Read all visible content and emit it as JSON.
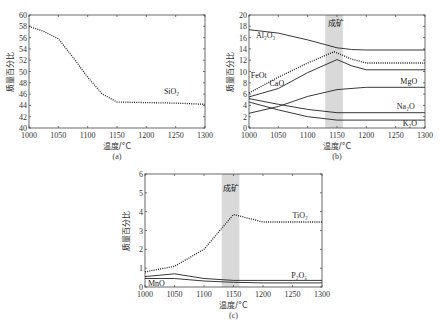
{
  "chart_data": [
    {
      "id": "a",
      "type": "line",
      "caption": "(a)",
      "xlabel": "温度/°C",
      "ylabel": "质量百分比",
      "xlim": [
        1000,
        1300
      ],
      "ylim": [
        40,
        60
      ],
      "xticks": [
        1000,
        1050,
        1100,
        1150,
        1200,
        1250,
        1300
      ],
      "yticks": [
        40,
        42,
        44,
        46,
        48,
        50,
        52,
        54,
        56,
        58,
        60
      ],
      "series": [
        {
          "name": "SiO2",
          "label": "SiO₂",
          "style": "dotted",
          "x": [
            1000,
            1025,
            1050,
            1075,
            1100,
            1125,
            1150,
            1200,
            1250,
            1300
          ],
          "values": [
            58.0,
            57.1,
            55.8,
            52.5,
            49.0,
            46.0,
            44.6,
            44.5,
            44.4,
            44.2
          ]
        }
      ]
    },
    {
      "id": "b",
      "type": "line",
      "caption": "(b)",
      "xlabel": "温度/°C",
      "ylabel": "质量百分比",
      "xlim": [
        1000,
        1300
      ],
      "ylim": [
        0,
        20
      ],
      "xticks": [
        1000,
        1050,
        1100,
        1150,
        1200,
        1250,
        1300
      ],
      "yticks": [
        0,
        2,
        4,
        6,
        8,
        10,
        12,
        14,
        16,
        18,
        20
      ],
      "shaded_band": {
        "x": [
          1130,
          1160
        ],
        "label": "成矿"
      },
      "series": [
        {
          "name": "Al2O3",
          "label": "Al₂O₃",
          "style": "solid",
          "x": [
            1000,
            1050,
            1100,
            1150,
            1175,
            1200,
            1300
          ],
          "values": [
            17.4,
            16.8,
            15.6,
            14.2,
            13.9,
            13.8,
            13.8
          ]
        },
        {
          "name": "FeOt",
          "label": "FeOt",
          "style": "dotted",
          "x": [
            1000,
            1050,
            1100,
            1145,
            1175,
            1200,
            1300
          ],
          "values": [
            6.2,
            9.0,
            11.5,
            13.5,
            12.2,
            11.5,
            11.5
          ]
        },
        {
          "name": "CaO",
          "label": "CaO",
          "style": "solid",
          "x": [
            1000,
            1050,
            1100,
            1150,
            1175,
            1200,
            1300
          ],
          "values": [
            5.5,
            7.0,
            9.8,
            12.1,
            11.0,
            10.3,
            10.3
          ]
        },
        {
          "name": "MgO",
          "label": "MgO",
          "style": "solid",
          "x": [
            1000,
            1050,
            1100,
            1150,
            1200,
            1300
          ],
          "values": [
            2.6,
            3.8,
            5.6,
            6.8,
            7.2,
            7.2
          ]
        },
        {
          "name": "Na2O",
          "label": "Na₂O",
          "style": "solid",
          "x": [
            1000,
            1050,
            1100,
            1150,
            1300
          ],
          "values": [
            5.2,
            4.2,
            3.3,
            2.7,
            2.7
          ]
        },
        {
          "name": "K2O",
          "label": "K₂O",
          "style": "solid",
          "x": [
            1000,
            1050,
            1100,
            1150,
            1300
          ],
          "values": [
            4.6,
            3.2,
            2.0,
            1.4,
            1.4
          ]
        }
      ]
    },
    {
      "id": "c",
      "type": "line",
      "caption": "(c)",
      "xlabel": "温度/°C",
      "ylabel": "质量百分比",
      "xlim": [
        1000,
        1300
      ],
      "ylim": [
        0,
        6
      ],
      "xticks": [
        1000,
        1050,
        1100,
        1150,
        1200,
        1250,
        1300
      ],
      "yticks": [
        0,
        1,
        2,
        3,
        4,
        5,
        6
      ],
      "shaded_band": {
        "x": [
          1130,
          1160
        ],
        "label": "成矿"
      },
      "series": [
        {
          "name": "TiO2",
          "label": "TiO₂",
          "style": "dotted",
          "x": [
            1000,
            1050,
            1100,
            1150,
            1200,
            1250,
            1300
          ],
          "values": [
            0.8,
            1.1,
            2.0,
            3.85,
            3.45,
            3.45,
            3.45
          ]
        },
        {
          "name": "P2O5",
          "label": "P₂O₅",
          "style": "solid",
          "x": [
            1000,
            1050,
            1100,
            1150,
            1200,
            1300
          ],
          "values": [
            0.55,
            0.7,
            0.45,
            0.35,
            0.35,
            0.35
          ]
        },
        {
          "name": "MnO",
          "label": "MnO",
          "style": "solid",
          "x": [
            1000,
            1050,
            1100,
            1150,
            1200,
            1300
          ],
          "values": [
            0.45,
            0.45,
            0.32,
            0.25,
            0.22,
            0.22
          ]
        }
      ]
    }
  ],
  "layout": [
    {
      "id": "a",
      "frame": [
        29,
        15,
        205,
        128
      ]
    },
    {
      "id": "b",
      "frame": [
        249,
        15,
        425,
        128
      ]
    },
    {
      "id": "c",
      "frame": [
        145,
        174,
        322,
        287
      ]
    }
  ],
  "labels": {
    "a": [
      {
        "text": "SiO₂",
        "x": 1230,
        "y": 46.0
      }
    ],
    "b": [
      {
        "text": "Al₂O₃",
        "x": 1012,
        "y": 16.0
      },
      {
        "text": "FeOt",
        "x": 1003,
        "y": 8.8
      },
      {
        "text": "CaO",
        "x": 1035,
        "y": 7.4
      },
      {
        "text": "MgO",
        "x": 1258,
        "y": 7.8
      },
      {
        "text": "Na₂O",
        "x": 1252,
        "y": 3.4
      },
      {
        "text": "K₂O",
        "x": 1262,
        "y": 0.4
      },
      {
        "text": "成矿",
        "x": 1134,
        "y": 18.0
      }
    ],
    "c": [
      {
        "text": "TiO₂",
        "x": 1250,
        "y": 3.65
      },
      {
        "text": "P₂O₅",
        "x": 1248,
        "y": 0.5
      },
      {
        "text": "MnO",
        "x": 1005,
        "y": 0.05
      },
      {
        "text": "成矿",
        "x": 1133,
        "y": 5.1
      }
    ]
  }
}
